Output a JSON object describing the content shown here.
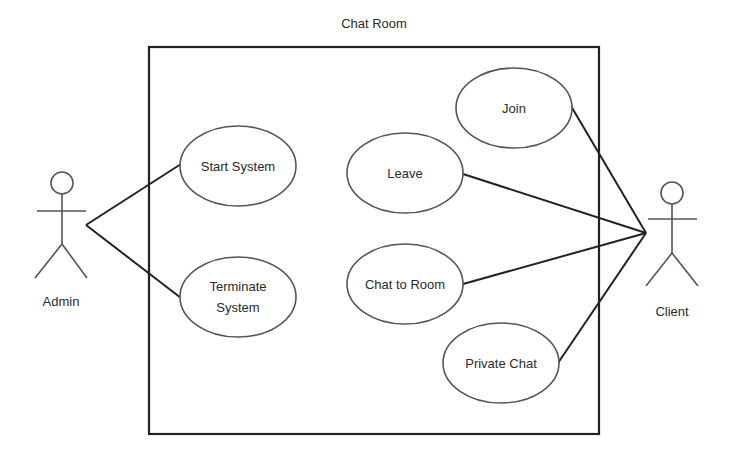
{
  "diagram": {
    "type": "uml-use-case",
    "title": "Chat Room",
    "colors": {
      "background": "#ffffff",
      "boundary_stroke": "#222222",
      "usecase_stroke": "#555555",
      "line_stroke": "#222222",
      "text": "#2b2b2b"
    },
    "system_boundary": {
      "label": "Chat Room",
      "x": 149,
      "y": 47,
      "width": 450,
      "height": 387
    },
    "actors": [
      {
        "id": "admin",
        "label": "Admin",
        "head": [
          62,
          183
        ],
        "anchor": [
          86,
          225
        ]
      },
      {
        "id": "client",
        "label": "Client",
        "head": [
          672,
          193
        ],
        "anchor": [
          646,
          233
        ]
      }
    ],
    "use_cases": [
      {
        "id": "start-system",
        "lines": [
          "Start System"
        ],
        "cx": 238,
        "cy": 166,
        "rx": 58,
        "ry": 40
      },
      {
        "id": "terminate-system",
        "lines": [
          "Terminate",
          "System"
        ],
        "cx": 238,
        "cy": 297,
        "rx": 58,
        "ry": 40
      },
      {
        "id": "join",
        "lines": [
          "Join"
        ],
        "cx": 514,
        "cy": 108,
        "rx": 58,
        "ry": 40
      },
      {
        "id": "leave",
        "lines": [
          "Leave"
        ],
        "cx": 405,
        "cy": 173,
        "rx": 58,
        "ry": 40
      },
      {
        "id": "chat-to-room",
        "lines": [
          "Chat to Room"
        ],
        "cx": 405,
        "cy": 284,
        "rx": 58,
        "ry": 40
      },
      {
        "id": "private-chat",
        "lines": [
          "Private Chat"
        ],
        "cx": 501,
        "cy": 363,
        "rx": 58,
        "ry": 40
      }
    ],
    "associations": [
      {
        "from": "admin",
        "to": "start-system"
      },
      {
        "from": "admin",
        "to": "terminate-system"
      },
      {
        "from": "client",
        "to": "join"
      },
      {
        "from": "client",
        "to": "leave"
      },
      {
        "from": "client",
        "to": "chat-to-room"
      },
      {
        "from": "client",
        "to": "private-chat"
      }
    ]
  }
}
